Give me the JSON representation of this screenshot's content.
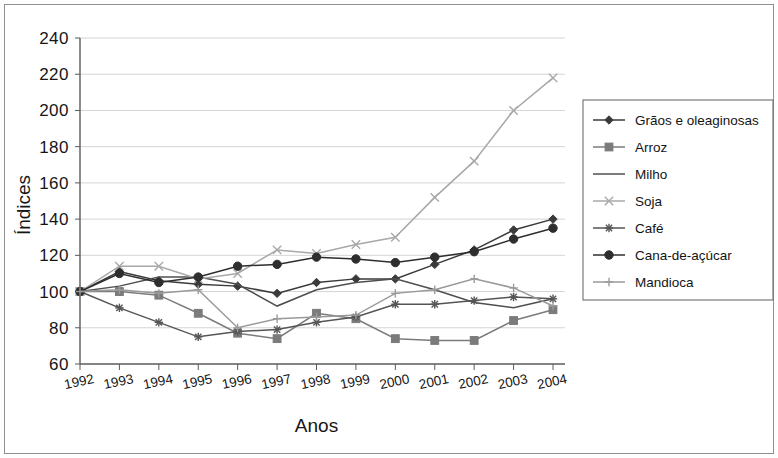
{
  "chart_data": {
    "type": "line",
    "title": "",
    "xlabel": "Anos",
    "ylabel": "Índices",
    "categories": [
      "1992",
      "1993",
      "1994",
      "1995",
      "1996",
      "1997",
      "1998",
      "1999",
      "2000",
      "2001",
      "2002",
      "2003",
      "2004"
    ],
    "x": [
      1992,
      1993,
      1994,
      1995,
      1996,
      1997,
      1998,
      1999,
      2000,
      2001,
      2002,
      2003,
      2004
    ],
    "ylim": [
      60,
      240
    ],
    "yticks": [
      60,
      80,
      100,
      120,
      140,
      160,
      180,
      200,
      220,
      240
    ],
    "grid": true,
    "legend_position": "right",
    "series": [
      {
        "name": "Grãos e oleaginosas",
        "marker": "diamond",
        "color": "#3a3a3a",
        "values": [
          100,
          111,
          106,
          104,
          103,
          99,
          105,
          107,
          107,
          115,
          123,
          134,
          140
        ]
      },
      {
        "name": "Arroz",
        "marker": "square",
        "color": "#7b7b7b",
        "values": [
          100,
          100,
          98,
          88,
          77,
          74,
          88,
          85,
          74,
          73,
          73,
          84,
          90
        ]
      },
      {
        "name": "Milho",
        "marker": "none",
        "color": "#4f4f4f",
        "values": [
          100,
          103,
          108,
          108,
          104,
          92,
          101,
          105,
          107,
          101,
          94,
          91,
          96
        ]
      },
      {
        "name": "Soja",
        "marker": "x",
        "color": "#a8a8a8",
        "values": [
          100,
          114,
          114,
          107,
          110,
          123,
          121,
          126,
          130,
          152,
          172,
          200,
          218
        ]
      },
      {
        "name": "Café",
        "marker": "star",
        "color": "#555555",
        "values": [
          100,
          91,
          83,
          75,
          78,
          79,
          83,
          86,
          93,
          93,
          95,
          97,
          96
        ]
      },
      {
        "name": "Cana-de-açúcar",
        "marker": "circle",
        "color": "#2e2e2e",
        "values": [
          100,
          110,
          105,
          108,
          114,
          115,
          119,
          118,
          116,
          119,
          122,
          129,
          135
        ]
      },
      {
        "name": "Mandioca",
        "marker": "plus",
        "color": "#9a9a9a",
        "values": [
          100,
          101,
          99,
          101,
          80,
          85,
          86,
          87,
          99,
          101,
          107,
          102,
          92
        ]
      }
    ]
  },
  "legend": {
    "items": [
      {
        "label": "Grãos e oleaginosas"
      },
      {
        "label": "Arroz"
      },
      {
        "label": "Milho"
      },
      {
        "label": "Soja"
      },
      {
        "label": "Café"
      },
      {
        "label": "Cana-de-açúcar"
      },
      {
        "label": "Mandioca"
      }
    ]
  }
}
